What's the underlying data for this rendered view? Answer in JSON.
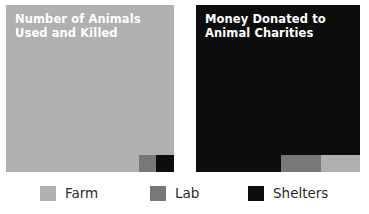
{
  "figure": {
    "background_color": "#ffffff"
  },
  "palette": {
    "farm": "#b0b0b0",
    "lab": "#787878",
    "shelters": "#0d0d0d",
    "title_text": "#ffffff",
    "legend_text": "#2b2b2b"
  },
  "charts": [
    {
      "id": "animals-used-and-killed",
      "title": "Number of Animals\nUsed and Killed",
      "title_line_1": "Number of Animals",
      "title_line_2": "Used and Killed",
      "dominant_category": "Farm"
    },
    {
      "id": "money-donated-to-animal-charities",
      "title": "Money Donated to\nAnimal Charities",
      "title_line_1": "Money Donated to",
      "title_line_2": "Animal Charities",
      "dominant_category": "Shelters"
    }
  ],
  "legend": {
    "position": "bottom",
    "items": [
      {
        "label": "Farm",
        "color": "#b0b0b0"
      },
      {
        "label": "Lab",
        "color": "#787878"
      },
      {
        "label": "Shelters",
        "color": "#0d0d0d"
      }
    ]
  },
  "chart_data": {
    "type": "area",
    "subtype": "proportional-square-area",
    "categories": [
      "Farm",
      "Lab",
      "Shelters"
    ],
    "colors": [
      "#b0b0b0",
      "#787878",
      "#0d0d0d"
    ],
    "legend_position": "bottom",
    "grid": false,
    "xlabel": "",
    "ylabel": "",
    "panels": [
      {
        "title": "Number of Animals Used and Killed",
        "values_pct": [
          98.5,
          1.0,
          0.5
        ],
        "squares": [
          {
            "category": "Farm",
            "x_pct": 0.0,
            "y_pct": 0.0,
            "w_pct": 100.0,
            "h_pct": 100.0
          },
          {
            "category": "Lab",
            "x_pct": 79.2,
            "y_pct": 89.8,
            "w_pct": 10.1,
            "h_pct": 10.2
          },
          {
            "category": "Shelters",
            "x_pct": 89.3,
            "y_pct": 89.8,
            "w_pct": 10.7,
            "h_pct": 10.2
          }
        ]
      },
      {
        "title": "Money Donated to Animal Charities",
        "values_pct": [
          14.0,
          11.0,
          75.0
        ],
        "squares": [
          {
            "category": "Shelters",
            "x_pct": 0.0,
            "y_pct": 0.0,
            "w_pct": 100.0,
            "h_pct": 100.0
          },
          {
            "category": "Lab",
            "x_pct": 51.8,
            "y_pct": 89.8,
            "w_pct": 24.4,
            "h_pct": 10.2
          },
          {
            "category": "Farm",
            "x_pct": 76.2,
            "y_pct": 89.8,
            "w_pct": 23.8,
            "h_pct": 10.2
          }
        ]
      }
    ]
  }
}
